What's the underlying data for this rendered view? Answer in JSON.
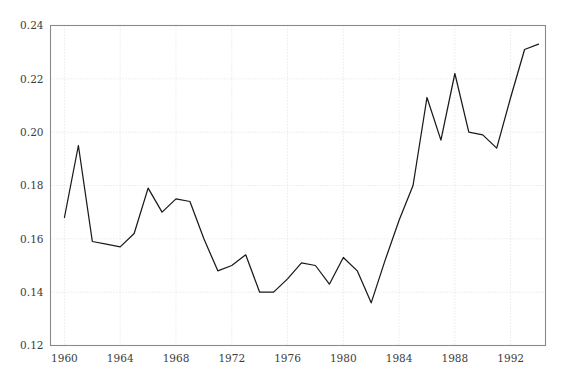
{
  "chart_data": {
    "type": "line",
    "title": "",
    "subtitle": "",
    "xlabel": "",
    "ylabel": "",
    "xlim": [
      1959.0,
      1994.5
    ],
    "ylim": [
      0.12,
      0.24
    ],
    "grid": true,
    "legend": null,
    "legend_position": "none",
    "line_color": "#1a1a1a",
    "grid_color": "#d2d2d2",
    "frame_color": "#8a8a8a",
    "text_color": "#3c3c3c",
    "background_color": "#ffffff",
    "xticks": [
      1960,
      1964,
      1968,
      1972,
      1976,
      1980,
      1984,
      1988,
      1992
    ],
    "xtick_labels": [
      "1960",
      "1964",
      "1968",
      "1972",
      "1976",
      "1980",
      "1984",
      "1988",
      "1992"
    ],
    "yticks": [
      0.12,
      0.14,
      0.16,
      0.18,
      0.2,
      0.22,
      0.24
    ],
    "ytick_labels": [
      "0.12",
      "0.14",
      "0.16",
      "0.18",
      "0.20",
      "0.22",
      "0.24"
    ],
    "x": [
      1960,
      1961,
      1962,
      1963,
      1964,
      1965,
      1966,
      1967,
      1968,
      1969,
      1970,
      1971,
      1972,
      1973,
      1974,
      1975,
      1976,
      1977,
      1978,
      1979,
      1980,
      1981,
      1982,
      1983,
      1984,
      1985,
      1986,
      1987,
      1988,
      1989,
      1990,
      1991,
      1992,
      1993,
      1994
    ],
    "values": [
      0.168,
      0.195,
      0.159,
      0.158,
      0.157,
      0.162,
      0.179,
      0.17,
      0.175,
      0.174,
      0.16,
      0.148,
      0.15,
      0.154,
      0.14,
      0.14,
      0.145,
      0.151,
      0.15,
      0.143,
      0.153,
      0.148,
      0.136,
      0.152,
      0.167,
      0.18,
      0.213,
      0.197,
      0.222,
      0.2,
      0.199,
      0.194,
      0.213,
      0.231,
      0.233
    ],
    "series": [
      {
        "name": "",
        "values": [
          0.168,
          0.195,
          0.159,
          0.158,
          0.157,
          0.162,
          0.179,
          0.17,
          0.175,
          0.174,
          0.16,
          0.148,
          0.15,
          0.154,
          0.14,
          0.14,
          0.145,
          0.151,
          0.15,
          0.143,
          0.153,
          0.148,
          0.136,
          0.152,
          0.167,
          0.18,
          0.213,
          0.197,
          0.222,
          0.2,
          0.199,
          0.194,
          0.213,
          0.231,
          0.233
        ]
      }
    ],
    "annotations": []
  }
}
